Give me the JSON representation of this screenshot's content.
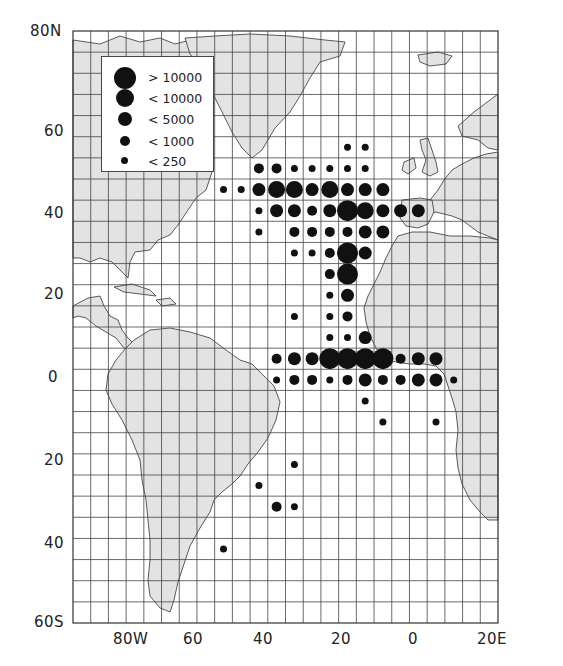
{
  "chart_data": {
    "type": "scatter",
    "subtype": "proportional-symbol-map",
    "title": "",
    "xlabel": "Longitude",
    "ylabel": "Latitude",
    "x_range_deg": [
      -95,
      25
    ],
    "y_range_deg": [
      -60,
      80
    ],
    "grid": {
      "on": true,
      "step_deg": 5
    },
    "x_ticks": [
      {
        "label": "80W",
        "value": -80
      },
      {
        "label": "60",
        "value": -60
      },
      {
        "label": "40",
        "value": -40
      },
      {
        "label": "20",
        "value": -20
      },
      {
        "label": "0",
        "value": 0
      },
      {
        "label": "20E",
        "value": 20
      }
    ],
    "y_ticks": [
      {
        "label": "80N",
        "value": 80
      },
      {
        "label": "60",
        "value": 60
      },
      {
        "label": "40",
        "value": 40
      },
      {
        "label": "20",
        "value": 20
      },
      {
        "label": "0",
        "value": 0
      },
      {
        "label": "20",
        "value": -20
      },
      {
        "label": "40",
        "value": -40
      },
      {
        "label": "60S",
        "value": -60
      }
    ],
    "legend": {
      "position": "top-left",
      "classes": [
        {
          "label": "> 10000",
          "size": 5,
          "radius": 10.5
        },
        {
          "label": "< 10000",
          "size": 4,
          "radius": 8.5
        },
        {
          "label": "< 5000",
          "size": 3,
          "radius": 6.5
        },
        {
          "label": "< 1000",
          "size": 2,
          "radius": 5
        },
        {
          "label": "< 250",
          "size": 1,
          "radius": 3.5
        }
      ]
    },
    "points": [
      {
        "lon": -17.5,
        "lat": 52.5,
        "size": 1
      },
      {
        "lon": -12.5,
        "lat": 52.5,
        "size": 1
      },
      {
        "lon": -42.5,
        "lat": 47.5,
        "size": 2
      },
      {
        "lon": -37.5,
        "lat": 47.5,
        "size": 2
      },
      {
        "lon": -32.5,
        "lat": 47.5,
        "size": 1
      },
      {
        "lon": -27.5,
        "lat": 47.5,
        "size": 1
      },
      {
        "lon": -22.5,
        "lat": 47.5,
        "size": 1
      },
      {
        "lon": -17.5,
        "lat": 47.5,
        "size": 1
      },
      {
        "lon": -12.5,
        "lat": 47.5,
        "size": 1
      },
      {
        "lon": -52.5,
        "lat": 42.5,
        "size": 1
      },
      {
        "lon": -47.5,
        "lat": 42.5,
        "size": 1
      },
      {
        "lon": -42.5,
        "lat": 42.5,
        "size": 3
      },
      {
        "lon": -37.5,
        "lat": 42.5,
        "size": 4
      },
      {
        "lon": -32.5,
        "lat": 42.5,
        "size": 4
      },
      {
        "lon": -27.5,
        "lat": 42.5,
        "size": 3
      },
      {
        "lon": -22.5,
        "lat": 42.5,
        "size": 4
      },
      {
        "lon": -17.5,
        "lat": 42.5,
        "size": 3
      },
      {
        "lon": -12.5,
        "lat": 42.5,
        "size": 3
      },
      {
        "lon": -7.5,
        "lat": 42.5,
        "size": 3
      },
      {
        "lon": -42.5,
        "lat": 37.5,
        "size": 1
      },
      {
        "lon": -37.5,
        "lat": 37.5,
        "size": 3
      },
      {
        "lon": -32.5,
        "lat": 37.5,
        "size": 3
      },
      {
        "lon": -27.5,
        "lat": 37.5,
        "size": 2
      },
      {
        "lon": -22.5,
        "lat": 37.5,
        "size": 3
      },
      {
        "lon": -17.5,
        "lat": 37.5,
        "size": 5
      },
      {
        "lon": -12.5,
        "lat": 37.5,
        "size": 4
      },
      {
        "lon": -7.5,
        "lat": 37.5,
        "size": 3
      },
      {
        "lon": -2.5,
        "lat": 37.5,
        "size": 3
      },
      {
        "lon": 2.5,
        "lat": 37.5,
        "size": 3
      },
      {
        "lon": -42.5,
        "lat": 32.5,
        "size": 1
      },
      {
        "lon": -32.5,
        "lat": 32.5,
        "size": 2
      },
      {
        "lon": -27.5,
        "lat": 32.5,
        "size": 2
      },
      {
        "lon": -22.5,
        "lat": 32.5,
        "size": 2
      },
      {
        "lon": -17.5,
        "lat": 32.5,
        "size": 2
      },
      {
        "lon": -12.5,
        "lat": 32.5,
        "size": 3
      },
      {
        "lon": -7.5,
        "lat": 32.5,
        "size": 3
      },
      {
        "lon": -32.5,
        "lat": 27.5,
        "size": 1
      },
      {
        "lon": -27.5,
        "lat": 27.5,
        "size": 1
      },
      {
        "lon": -22.5,
        "lat": 27.5,
        "size": 2
      },
      {
        "lon": -17.5,
        "lat": 27.5,
        "size": 5
      },
      {
        "lon": -12.5,
        "lat": 27.5,
        "size": 3
      },
      {
        "lon": -22.5,
        "lat": 22.5,
        "size": 2
      },
      {
        "lon": -17.5,
        "lat": 22.5,
        "size": 5
      },
      {
        "lon": -22.5,
        "lat": 17.5,
        "size": 1
      },
      {
        "lon": -17.5,
        "lat": 17.5,
        "size": 3
      },
      {
        "lon": -32.5,
        "lat": 12.5,
        "size": 1
      },
      {
        "lon": -22.5,
        "lat": 12.5,
        "size": 1
      },
      {
        "lon": -17.5,
        "lat": 12.5,
        "size": 2
      },
      {
        "lon": -22.5,
        "lat": 7.5,
        "size": 1
      },
      {
        "lon": -17.5,
        "lat": 7.5,
        "size": 1
      },
      {
        "lon": -12.5,
        "lat": 7.5,
        "size": 3
      },
      {
        "lon": -37.5,
        "lat": 2.5,
        "size": 2
      },
      {
        "lon": -32.5,
        "lat": 2.5,
        "size": 3
      },
      {
        "lon": -27.5,
        "lat": 2.5,
        "size": 3
      },
      {
        "lon": -22.5,
        "lat": 2.5,
        "size": 5
      },
      {
        "lon": -17.5,
        "lat": 2.5,
        "size": 5
      },
      {
        "lon": -12.5,
        "lat": 2.5,
        "size": 5
      },
      {
        "lon": -7.5,
        "lat": 2.5,
        "size": 5
      },
      {
        "lon": -2.5,
        "lat": 2.5,
        "size": 2
      },
      {
        "lon": 2.5,
        "lat": 2.5,
        "size": 3
      },
      {
        "lon": 7.5,
        "lat": 2.5,
        "size": 3
      },
      {
        "lon": -37.5,
        "lat": -2.5,
        "size": 1
      },
      {
        "lon": -32.5,
        "lat": -2.5,
        "size": 2
      },
      {
        "lon": -27.5,
        "lat": -2.5,
        "size": 2
      },
      {
        "lon": -22.5,
        "lat": -2.5,
        "size": 1
      },
      {
        "lon": -17.5,
        "lat": -2.5,
        "size": 2
      },
      {
        "lon": -12.5,
        "lat": -2.5,
        "size": 3
      },
      {
        "lon": -7.5,
        "lat": -2.5,
        "size": 2
      },
      {
        "lon": -2.5,
        "lat": -2.5,
        "size": 2
      },
      {
        "lon": 2.5,
        "lat": -2.5,
        "size": 3
      },
      {
        "lon": 7.5,
        "lat": -2.5,
        "size": 3
      },
      {
        "lon": 12.5,
        "lat": -2.5,
        "size": 1
      },
      {
        "lon": -12.5,
        "lat": -7.5,
        "size": 1
      },
      {
        "lon": -7.5,
        "lat": -12.5,
        "size": 1
      },
      {
        "lon": 7.5,
        "lat": -12.5,
        "size": 1
      },
      {
        "lon": -32.5,
        "lat": -22.5,
        "size": 1
      },
      {
        "lon": -42.5,
        "lat": -27.5,
        "size": 1
      },
      {
        "lon": -37.5,
        "lat": -32.5,
        "size": 2
      },
      {
        "lon": -32.5,
        "lat": -32.5,
        "size": 1
      },
      {
        "lon": -52.5,
        "lat": -42.5,
        "size": 1
      }
    ]
  },
  "colors": {
    "land": "#e3e3e3",
    "coast": "#333333",
    "grid": "#444444",
    "ocean": "#ffffff",
    "dot": "#111111"
  },
  "legend_labels": [
    "> 10000",
    "< 10000",
    "< 5000",
    "< 1000",
    "< 250"
  ]
}
